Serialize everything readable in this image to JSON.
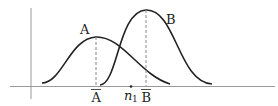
{
  "diagram": {
    "type": "two normal distribution curves",
    "curves": [
      {
        "name": "A",
        "label": "A",
        "mean_label": "A",
        "mean_overlined": true,
        "peak_x": 96,
        "peak_y": 37
      },
      {
        "name": "B",
        "label": "B",
        "mean_label": "B",
        "mean_overlined": true,
        "peak_x": 146,
        "peak_y": 10
      }
    ],
    "point": {
      "label": "n",
      "subscript": "1",
      "x": 130
    },
    "colors": {
      "stroke": "#222222",
      "dashed": "#888888",
      "axis": "#999999"
    }
  }
}
